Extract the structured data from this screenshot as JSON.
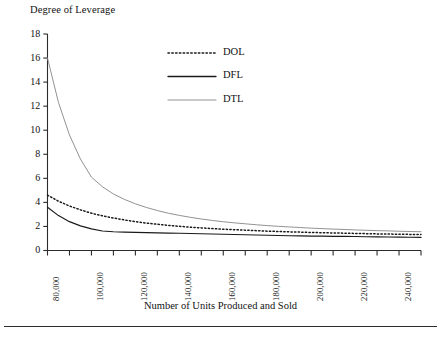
{
  "chart_data": {
    "type": "line",
    "title": "Degree of Leverage",
    "ylabel": "Degree of Leverage",
    "xlabel": "Number of Units Produced and Sold",
    "ylim": [
      0,
      18
    ],
    "xlim": [
      80000,
      250000
    ],
    "ytick_labels": [
      "0",
      "2",
      "4",
      "6",
      "8",
      "10",
      "12",
      "14",
      "16",
      "18"
    ],
    "ytick_values": [
      0,
      2,
      4,
      6,
      8,
      10,
      12,
      14,
      16,
      18
    ],
    "xtick_labels": [
      "80,000",
      "100,000",
      "120,000",
      "140,000",
      "160,000",
      "180,000",
      "200,000",
      "220,000",
      "240,000"
    ],
    "xtick_values": [
      80000,
      100000,
      120000,
      140000,
      160000,
      180000,
      200000,
      220000,
      240000
    ],
    "xminor_step": 10000,
    "grid": false,
    "legend_position": "upper-center",
    "legend": [
      "DOL",
      "DFL",
      "DTL"
    ],
    "x": [
      80000,
      85000,
      90000,
      95000,
      100000,
      105000,
      110000,
      115000,
      120000,
      125000,
      130000,
      135000,
      140000,
      145000,
      150000,
      155000,
      160000,
      165000,
      170000,
      175000,
      180000,
      185000,
      190000,
      195000,
      200000,
      205000,
      210000,
      215000,
      220000,
      225000,
      230000,
      235000,
      240000,
      245000,
      250000
    ],
    "series": [
      {
        "name": "DOL",
        "style": "dotted",
        "color": "#1a1a1a",
        "values": [
          4.6,
          4.1,
          3.7,
          3.38,
          3.1,
          2.88,
          2.7,
          2.54,
          2.4,
          2.28,
          2.18,
          2.09,
          2.01,
          1.94,
          1.88,
          1.82,
          1.77,
          1.73,
          1.69,
          1.65,
          1.61,
          1.58,
          1.55,
          1.53,
          1.5,
          1.48,
          1.46,
          1.44,
          1.42,
          1.4,
          1.38,
          1.37,
          1.35,
          1.34,
          1.33
        ]
      },
      {
        "name": "DFL",
        "style": "solid",
        "color": "#1a1a1a",
        "values": [
          3.6,
          2.9,
          2.4,
          2.05,
          1.8,
          1.62,
          1.56,
          1.53,
          1.51,
          1.49,
          1.47,
          1.45,
          1.43,
          1.41,
          1.39,
          1.37,
          1.35,
          1.33,
          1.31,
          1.29,
          1.27,
          1.25,
          1.23,
          1.22,
          1.2,
          1.19,
          1.18,
          1.17,
          1.16,
          1.14,
          1.13,
          1.12,
          1.11,
          1.1,
          1.09
        ]
      },
      {
        "name": "DTL",
        "style": "solid",
        "color": "#8c8c8c",
        "values": [
          16.0,
          12.3,
          9.6,
          7.6,
          6.1,
          5.3,
          4.7,
          4.25,
          3.88,
          3.58,
          3.32,
          3.1,
          2.92,
          2.76,
          2.62,
          2.5,
          2.39,
          2.3,
          2.22,
          2.14,
          2.07,
          2.01,
          1.96,
          1.91,
          1.86,
          1.82,
          1.78,
          1.75,
          1.71,
          1.68,
          1.65,
          1.63,
          1.6,
          1.58,
          1.56
        ]
      }
    ]
  },
  "axis": {
    "title": "Degree of Leverage",
    "xaxis_title": "Number of Units Produced and Sold"
  },
  "legend": {
    "items": [
      {
        "label": "DOL"
      },
      {
        "label": "DFL"
      },
      {
        "label": "DTL"
      }
    ]
  },
  "colors": {
    "dol": "#1a1a1a",
    "dfl": "#1a1a1a",
    "dtl": "#8c8c8c",
    "axis": "#2b2b2b",
    "text": "#121212"
  }
}
